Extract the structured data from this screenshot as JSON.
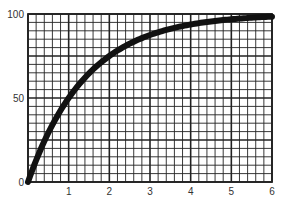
{
  "chart_data": {
    "type": "line",
    "title": "",
    "xlabel": "",
    "ylabel": "",
    "x": [
      0,
      0.5,
      1,
      1.5,
      2,
      2.5,
      3,
      3.5,
      4,
      4.5,
      5,
      5.5,
      6
    ],
    "series": [
      {
        "name": "curve",
        "values": [
          0,
          29.3,
          50,
          64.6,
          75,
          82.3,
          87.5,
          91.2,
          93.8,
          95.6,
          96.9,
          97.8,
          98.4
        ]
      }
    ],
    "xlim": [
      0,
      6
    ],
    "ylim": [
      0,
      100
    ],
    "x_ticks": [
      "1",
      "2",
      "3",
      "4",
      "5",
      "6"
    ],
    "y_ticks": [
      "0",
      "50",
      "100"
    ],
    "grid": true,
    "grid_minor_x_per_unit": 5,
    "grid_minor_y_step": 5,
    "grid_major_y_step": 25,
    "legend": "none",
    "colors": {
      "line": "#111111",
      "grid": "#222222",
      "text": "#333333"
    }
  }
}
